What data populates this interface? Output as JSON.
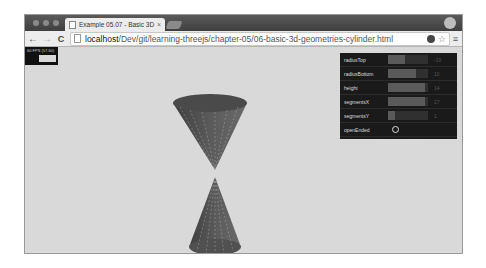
{
  "browser": {
    "tab_title": "Example 05.07 - Basic 3D",
    "url_host": "localhost",
    "url_path": "/Dev/git/learning-threejs/chapter-05/06-basic-3d-geometries-cylinder.html",
    "nav": {
      "back": "←",
      "forward": "→",
      "reload": "C"
    },
    "menu_glyph": "≡",
    "star_glyph": "☆",
    "tab_close": "×"
  },
  "stats": {
    "label": "60 FPS (57-60)"
  },
  "controls": {
    "rows": [
      {
        "label": "radiusTop",
        "value": "-10",
        "fill_pct": 42
      },
      {
        "label": "radiusBottom",
        "value": "10",
        "fill_pct": 70
      },
      {
        "label": "height",
        "value": "14",
        "fill_pct": 93
      },
      {
        "label": "segmentsX",
        "value": "17",
        "fill_pct": 93
      },
      {
        "label": "segmentsY",
        "value": "1",
        "fill_pct": 18
      }
    ],
    "open_ended_label": "openEnded",
    "open_ended": false,
    "close_label": "Close Controls"
  },
  "colors": {
    "cone": "#5a5a5a",
    "background": "#d9d9d9",
    "panel": "#1a1a1a"
  }
}
